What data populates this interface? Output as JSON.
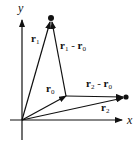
{
  "diagram": {
    "type": "vector-diagram",
    "axes": {
      "x_label": "x",
      "y_label": "y"
    },
    "vectors": [
      {
        "id": "r0",
        "name": "r",
        "sub": "0",
        "from": "origin",
        "to": "P0"
      },
      {
        "id": "r1",
        "name": "r",
        "sub": "1",
        "from": "origin",
        "to": "P1"
      },
      {
        "id": "r2",
        "name": "r",
        "sub": "2",
        "from": "origin",
        "to": "P2"
      },
      {
        "id": "r1-r0",
        "name": "r",
        "sub": "1",
        "minus_name": "r",
        "minus_sub": "0",
        "from": "P0",
        "to": "P1"
      },
      {
        "id": "r2-r0",
        "name": "r",
        "sub": "2",
        "minus_name": "r",
        "minus_sub": "0",
        "from": "P0",
        "to": "P2"
      }
    ],
    "labels": {
      "r1": {
        "base": "r",
        "sub": "1"
      },
      "r1_minus_r0": {
        "base1": "r",
        "sub1": "1",
        "op": " - ",
        "base2": "r",
        "sub2": "0"
      },
      "r0": {
        "base": "r",
        "sub": "0"
      },
      "r2_minus_r0": {
        "base1": "r",
        "sub1": "2",
        "op": " - ",
        "base2": "r",
        "sub2": "0"
      },
      "r2": {
        "base": "r",
        "sub": "2"
      }
    },
    "colors": {
      "stroke": "#111111",
      "background": "#ffffff"
    }
  }
}
